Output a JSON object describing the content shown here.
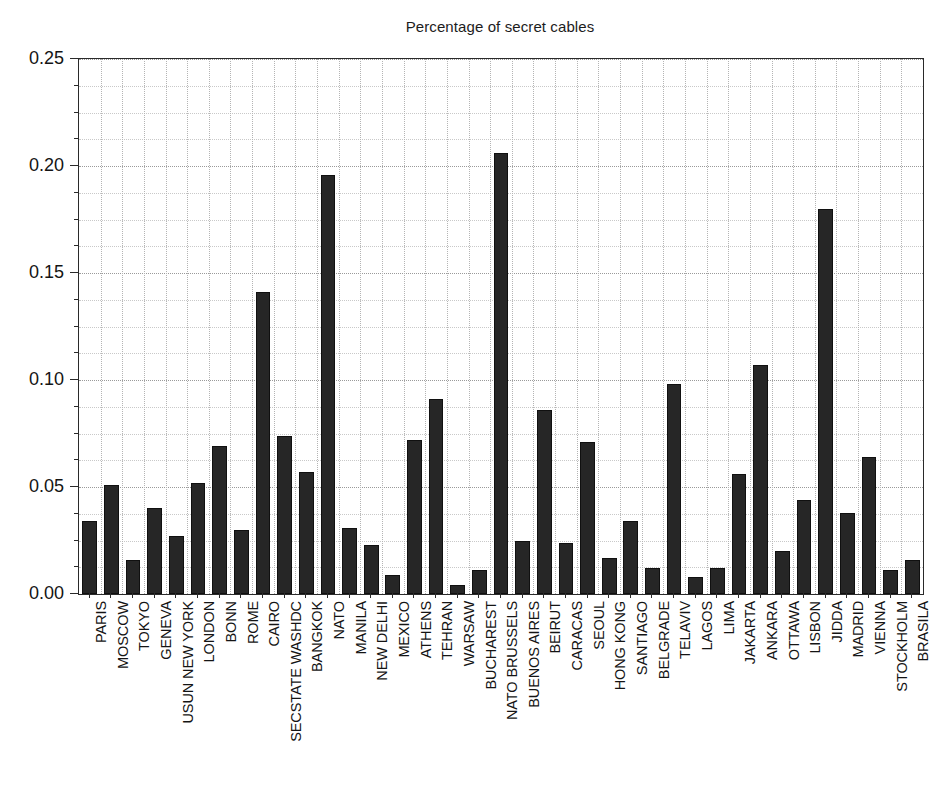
{
  "chart_data": {
    "type": "bar",
    "title": "Percentage of secret cables",
    "xlabel": "",
    "ylabel": "",
    "ylim": [
      0.0,
      0.25
    ],
    "ytick_labels": [
      "0.00",
      "0.05",
      "0.10",
      "0.15",
      "0.20",
      "0.25"
    ],
    "ytick_values": [
      0.0,
      0.05,
      0.1,
      0.15,
      0.2,
      0.25
    ],
    "yminor_step": 0.0125,
    "grid": true,
    "grid_style": "dotted",
    "legend": "none",
    "bar_color": "#262626",
    "background_color": "#ffffff",
    "axis_color": "#2a2a2a",
    "categories": [
      "PARIS",
      "MOSCOW",
      "TOKYO",
      "GENEVA",
      "USUN NEW YORK",
      "LONDON",
      "BONN",
      "ROME",
      "CAIRO",
      "SECSTATE WASHDC",
      "BANGKOK",
      "NATO",
      "MANILA",
      "NEW DELHI",
      "MEXICO",
      "ATHENS",
      "TEHRAN",
      "WARSAW",
      "BUCHAREST",
      "NATO BRUSSELS",
      "BUENOS AIRES",
      "BEIRUT",
      "CARACAS",
      "SEOUL",
      "HONG KONG",
      "SANTIAGO",
      "BELGRADE",
      "TELAVIV",
      "LAGOS",
      "LIMA",
      "JAKARTA",
      "ANKARA",
      "OTTAWA",
      "LISBON",
      "JIDDA",
      "MADRID",
      "VIENNA",
      "STOCKHOLM",
      "BRASILA"
    ],
    "values": [
      0.034,
      0.051,
      0.016,
      0.04,
      0.027,
      0.052,
      0.069,
      0.03,
      0.141,
      0.074,
      0.057,
      0.196,
      0.031,
      0.023,
      0.009,
      0.072,
      0.091,
      0.004,
      0.011,
      0.206,
      0.025,
      0.086,
      0.024,
      0.071,
      0.017,
      0.034,
      0.012,
      0.098,
      0.008,
      0.012,
      0.056,
      0.107,
      0.02,
      0.044,
      0.18,
      0.038,
      0.064,
      0.011,
      0.016
    ]
  }
}
